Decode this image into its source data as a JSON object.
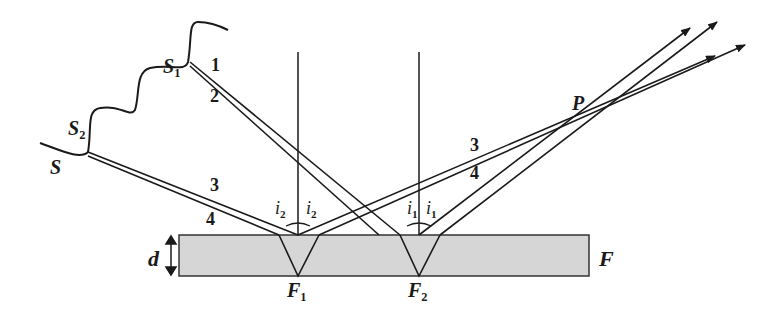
{
  "diagram": {
    "film": {
      "label": "F",
      "thickness_label": "d",
      "fill": "#d6d6d6"
    },
    "source": {
      "label": "S",
      "point1": "S",
      "point1_sub": "1",
      "point2": "S",
      "point2_sub": "2"
    },
    "rays": {
      "r1": "1",
      "r2": "2",
      "r3a": "3",
      "r4a": "4",
      "r3b": "3",
      "r4b": "4"
    },
    "angles": {
      "i2a": "i",
      "i2a_sub": "2",
      "i2b": "i",
      "i2b_sub": "2",
      "i1a": "i",
      "i1a_sub": "1",
      "i1b": "i",
      "i1b_sub": "1"
    },
    "points": {
      "F1": "F",
      "F1_sub": "1",
      "F2": "F",
      "F2_sub": "2",
      "P": "P"
    },
    "colors": {
      "line": "#1a1a1a",
      "film": "#d6d6d6"
    }
  }
}
